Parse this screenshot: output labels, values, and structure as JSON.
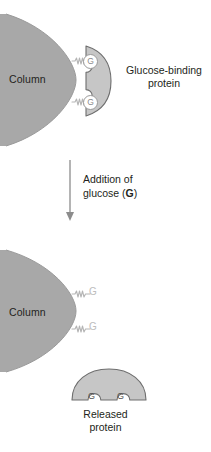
{
  "figure": {
    "colors": {
      "column_fill": "#a8a8a8",
      "column_stroke": "#8c8c8c",
      "protein_fill": "#c6c6c6",
      "protein_stroke": "#6e6e6e",
      "ligand_fill": "#ffffff",
      "ligand_stroke": "#9a9a9a",
      "linker_stroke": "#b5b5b5",
      "free_ligand_text": "#bdbdbd",
      "text": "#231f20",
      "arrow": "#8c8c8c",
      "background": "#ffffff"
    }
  },
  "top_panel": {
    "column_label": "Column",
    "protein_label_line1": "Glucose-binding",
    "protein_label_line2": "protein",
    "bound_ligands": [
      {
        "label": "G"
      },
      {
        "label": "G"
      }
    ]
  },
  "arrow_step": {
    "line1": "Addition of",
    "line2_prefix": "glucose (",
    "line2_bold": "G",
    "line2_suffix": ")",
    "direction": "down"
  },
  "bottom_panel": {
    "column_label": "Column",
    "free_ligands": [
      {
        "label": "G"
      },
      {
        "label": "G"
      }
    ],
    "released_protein": {
      "occupied_sites": [
        {
          "label": "G"
        },
        {
          "label": "G"
        }
      ],
      "caption_line1": "Released",
      "caption_line2": "protein"
    }
  }
}
